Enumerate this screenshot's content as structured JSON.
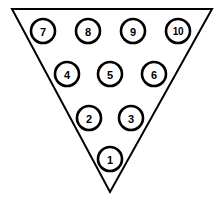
{
  "diagram": {
    "shape": "inverted-triangle",
    "colors": {
      "background": "#ffffff",
      "stroke": "#000000",
      "pin_fill": "#ffffff",
      "label": "#000000"
    },
    "outline": {
      "points": "12,9 212,9 110,192",
      "stroke_width": 2.0
    },
    "pin_radius": 12,
    "rows": [
      {
        "row_index": 0,
        "y": 31,
        "pins": [
          {
            "label": "7",
            "x": 43,
            "y": 31
          },
          {
            "label": "8",
            "x": 88,
            "y": 31
          },
          {
            "label": "9",
            "x": 133,
            "y": 31
          },
          {
            "label": "10",
            "x": 178,
            "y": 31
          }
        ]
      },
      {
        "row_index": 1,
        "y": 74,
        "pins": [
          {
            "label": "4",
            "x": 67,
            "y": 74
          },
          {
            "label": "5",
            "x": 110,
            "y": 74
          },
          {
            "label": "6",
            "x": 154,
            "y": 74
          }
        ]
      },
      {
        "row_index": 2,
        "y": 118,
        "pins": [
          {
            "label": "2",
            "x": 89,
            "y": 118
          },
          {
            "label": "3",
            "x": 131,
            "y": 118
          }
        ]
      },
      {
        "row_index": 3,
        "y": 159,
        "pins": [
          {
            "label": "1",
            "x": 110,
            "y": 159
          }
        ]
      }
    ]
  }
}
